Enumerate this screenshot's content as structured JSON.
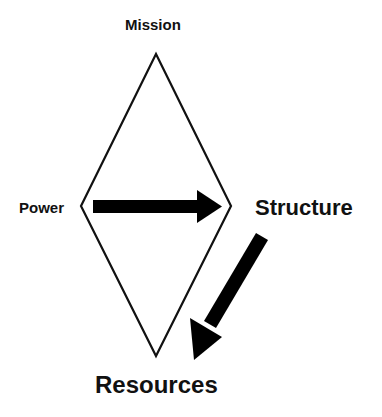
{
  "diagram": {
    "type": "diamond-flow",
    "labels": {
      "mission": "Mission",
      "power": "Power",
      "structure": "Structure",
      "resources": "Resources"
    },
    "shape": {
      "kind": "diamond",
      "vertices": {
        "top": [
          156,
          54
        ],
        "right": [
          231,
          206
        ],
        "bottom": [
          156,
          356
        ],
        "left": [
          81,
          206
        ]
      },
      "stroke": "#111111"
    },
    "arrows": [
      {
        "from": "Power",
        "to": "Structure",
        "direction": "right",
        "color": "#000000"
      },
      {
        "from": "Structure",
        "to": "Resources",
        "direction": "down-left",
        "color": "#000000"
      }
    ]
  }
}
